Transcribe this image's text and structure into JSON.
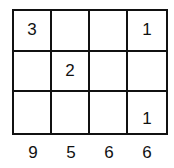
{
  "grid": {
    "rows": [
      [
        "3",
        "",
        "",
        "1"
      ],
      [
        "",
        "2",
        "",
        ""
      ],
      [
        "",
        "",
        "",
        "1"
      ]
    ]
  },
  "column_labels": [
    "9",
    "5",
    "6",
    "6"
  ]
}
